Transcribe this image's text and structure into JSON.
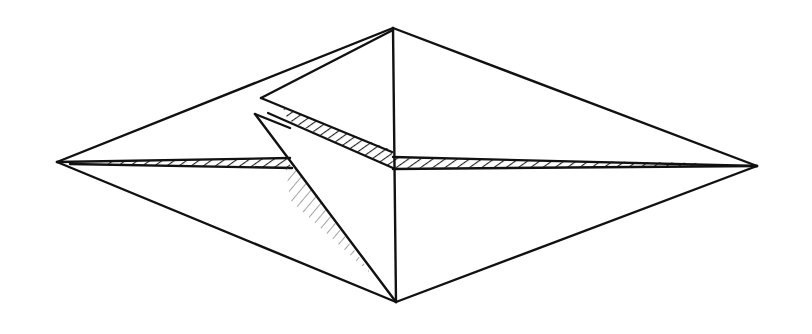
{
  "figure": {
    "background": "#ffffff",
    "ink_color": "#111111",
    "hatch_color": "#222222",
    "width": 812,
    "height": 334
  },
  "vertices": {
    "left_tip": [
      57,
      162
    ],
    "right_tip": [
      757,
      166
    ],
    "top": [
      393,
      28
    ],
    "bottom": [
      396,
      302
    ],
    "center": [
      393,
      163
    ],
    "upper_flap_point": [
      261,
      98
    ],
    "lower_flap_point": [
      255,
      114
    ],
    "midline_flap_cross": [
      286,
      163
    ]
  }
}
